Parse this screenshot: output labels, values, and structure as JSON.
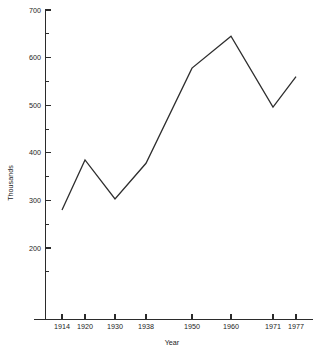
{
  "chart_data": {
    "type": "line",
    "title": "",
    "xlabel": "Year",
    "ylabel": "Thousands",
    "categories": [
      "1914",
      "1920",
      "1930",
      "1938",
      "1950",
      "1960",
      "1971",
      "1977"
    ],
    "x": [
      1914,
      1920,
      1930,
      1938,
      1950,
      1960,
      1971,
      1977
    ],
    "values": [
      280,
      385,
      303,
      378,
      578,
      645,
      496,
      560
    ],
    "series": [
      {
        "name": "",
        "values": [
          280,
          385,
          303,
          378,
          578,
          645,
          496,
          560
        ]
      }
    ],
    "ylim": [
      150,
      700
    ],
    "xlim": [
      1914,
      1977
    ],
    "y_major_ticks": [
      200,
      300,
      400,
      500,
      600,
      700
    ],
    "y_major_tick_labels": [
      "200",
      "300",
      "400",
      "500",
      "600",
      "700"
    ],
    "y_minor_ticks": [
      150,
      250,
      350,
      450,
      550,
      650
    ],
    "grid": false,
    "legend": "none",
    "line_color": "#2e2e2e",
    "axis_color": "#2b2b2b",
    "background_color": "#ffffff"
  },
  "axes": {
    "y_axis_title": "Thousands",
    "x_axis_title": "Year"
  }
}
